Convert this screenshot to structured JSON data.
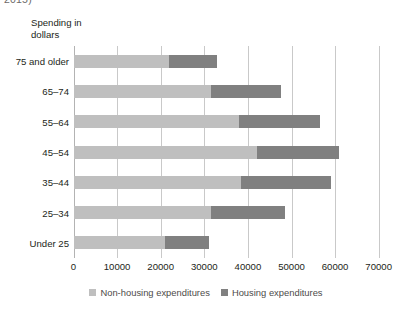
{
  "caption_fragment": "2015)",
  "axis_title": "Spending in dollars",
  "legend": {
    "items": [
      {
        "label": "Non-housing expenditures",
        "color": "#bfbfbf",
        "swatch_name": "legend-swatch-non-housing"
      },
      {
        "label": "Housing expenditures",
        "color": "#808080",
        "swatch_name": "legend-swatch-housing"
      }
    ]
  },
  "chart_data": {
    "type": "bar",
    "orientation": "horizontal",
    "stacked": true,
    "title": "",
    "subtitle": "",
    "xlabel": "",
    "ylabel": "Spending in dollars",
    "xlim": [
      0,
      70000
    ],
    "xticks": [
      0,
      10000,
      20000,
      30000,
      40000,
      50000,
      60000,
      70000
    ],
    "xtick_labels": [
      "0",
      "10000",
      "20000",
      "30000",
      "40000",
      "50000",
      "60000",
      "70000"
    ],
    "grid": true,
    "grid_axis": "x",
    "legend_position": "bottom-center",
    "categories": [
      "75 and older",
      "65–74",
      "55–64",
      "45–54",
      "35–44",
      "25–34",
      "Under 25"
    ],
    "series": [
      {
        "name": "Non-housing expenditures",
        "color": "#bfbfbf",
        "values": [
          22000,
          31500,
          38000,
          42000,
          38500,
          31500,
          21000
        ]
      },
      {
        "name": "Housing expenditures",
        "color": "#808080",
        "values": [
          11000,
          16000,
          18500,
          19000,
          20500,
          17000,
          10000
        ]
      }
    ],
    "totals": [
      33000,
      47500,
      56500,
      61000,
      59000,
      48500,
      31000
    ]
  }
}
